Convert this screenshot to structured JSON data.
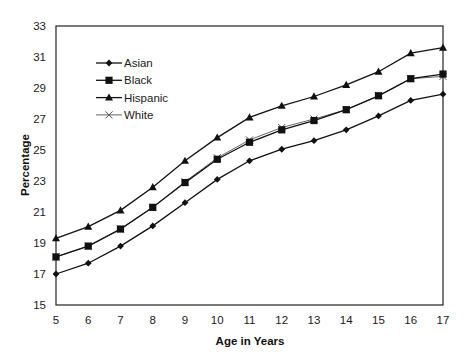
{
  "chart_data": {
    "type": "line",
    "title": "",
    "xlabel": "Age in Years",
    "ylabel": "Percentage",
    "x": [
      5,
      6,
      7,
      8,
      9,
      10,
      11,
      12,
      13,
      14,
      15,
      16,
      17
    ],
    "xlim": [
      5,
      17
    ],
    "ylim": [
      15,
      33
    ],
    "yticks": [
      15,
      17,
      19,
      21,
      23,
      25,
      27,
      29,
      31,
      33
    ],
    "xticks": [
      5,
      6,
      7,
      8,
      9,
      10,
      11,
      12,
      13,
      14,
      15,
      16,
      17
    ],
    "grid": false,
    "legend_position": "upper left inside",
    "series": [
      {
        "name": "Asian",
        "marker": "diamond",
        "color": "#111111",
        "values": [
          17.0,
          17.7,
          18.8,
          20.1,
          21.6,
          23.1,
          24.3,
          25.05,
          25.6,
          26.3,
          27.2,
          28.2,
          28.6
        ]
      },
      {
        "name": "Black",
        "marker": "square",
        "color": "#111111",
        "values": [
          18.1,
          18.8,
          19.9,
          21.3,
          22.9,
          24.4,
          25.5,
          26.3,
          26.9,
          27.6,
          28.5,
          29.6,
          29.9
        ]
      },
      {
        "name": "Hispanic",
        "marker": "triangle",
        "color": "#111111",
        "values": [
          19.3,
          20.05,
          21.1,
          22.6,
          24.3,
          25.8,
          27.1,
          27.85,
          28.45,
          29.2,
          30.05,
          31.25,
          31.6
        ]
      },
      {
        "name": "White",
        "marker": "x",
        "color": "#555555",
        "values": [
          18.1,
          18.8,
          19.9,
          21.3,
          22.95,
          24.5,
          25.65,
          26.45,
          27.0,
          27.6,
          28.5,
          29.6,
          29.75
        ]
      }
    ]
  }
}
